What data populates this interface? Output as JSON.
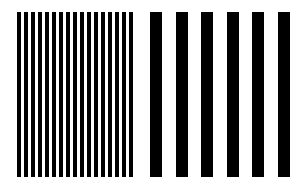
{
  "figure": {
    "background": "#ffffff",
    "bar_color": "#000000",
    "groups": [
      {
        "name": "fine-grating",
        "count": 17,
        "start_x": 17,
        "period": 7,
        "bar_width": 4,
        "top": 12,
        "height": 165
      },
      {
        "name": "coarse-grating",
        "count": 6,
        "start_x": 150,
        "period": 25.6,
        "bar_width": 12,
        "top": 12,
        "height": 165
      }
    ]
  }
}
